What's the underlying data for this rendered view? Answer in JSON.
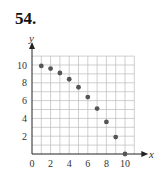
{
  "problem_number": "54.",
  "chart_data": {
    "type": "scatter",
    "title": "54.",
    "xlabel": "x",
    "ylabel": "y",
    "x": [
      1,
      2,
      3,
      4,
      5,
      6,
      7,
      8,
      9,
      10
    ],
    "values": [
      9.9,
      9.6,
      9.1,
      8.4,
      7.5,
      6.4,
      5.1,
      3.6,
      1.9,
      0
    ],
    "xlim": [
      0,
      11
    ],
    "ylim": [
      0,
      11
    ],
    "x_ticks": [
      "0",
      "2",
      "4",
      "6",
      "8",
      "10"
    ],
    "y_ticks": [
      "2",
      "4",
      "6",
      "8",
      "10"
    ],
    "grid": true,
    "legend": null
  },
  "colors": {
    "point": "#555555",
    "grid": "#bbbbbb",
    "axis": "#222222"
  }
}
